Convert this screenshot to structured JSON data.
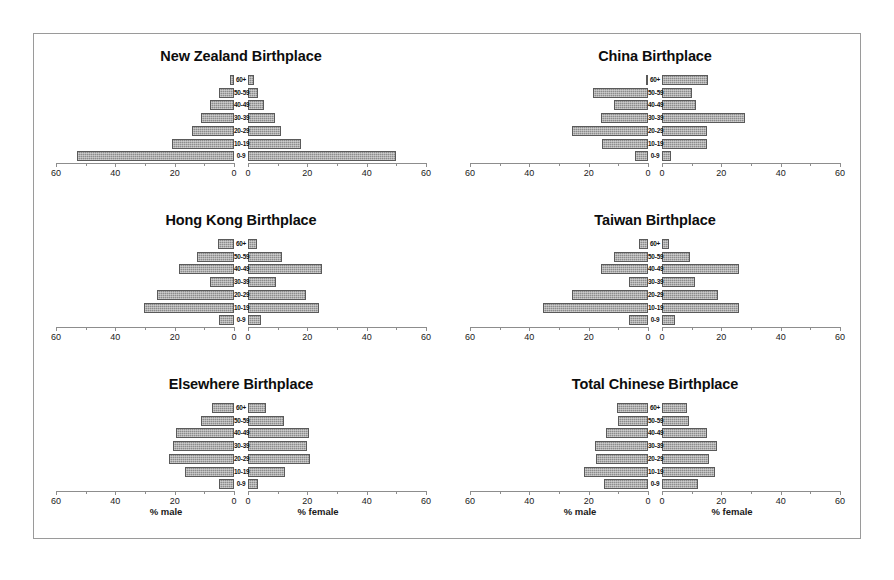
{
  "figure": {
    "axis_caption_male": "% male",
    "axis_caption_female": "% female",
    "bar_color": "#8c8c8c",
    "bar_border_color": "#5a5a5a",
    "frame_color": "#9a9a9a",
    "axis_color": "#8d8d8d"
  },
  "chart_data": {
    "type": "bar",
    "subtype": "population-pyramid",
    "title": "",
    "xlabel": "% male / % female",
    "ylabel": "Age group",
    "xlim": [
      0,
      60
    ],
    "xticks": [
      0,
      20,
      40,
      60
    ],
    "xtick_labels": [
      "0",
      "20",
      "40",
      "60"
    ],
    "minor_tick_step": 10,
    "grid": false,
    "legend": null,
    "categories": [
      "60+",
      "50-59",
      "40-49",
      "30-39",
      "20-29",
      "10-19",
      "0-9"
    ],
    "panels": [
      {
        "title": "New Zealand Birthplace",
        "series": [
          {
            "name": "% male",
            "values": [
              1.5,
              5.0,
              8.0,
              11.0,
              14.0,
              21.0,
              53.0
            ]
          },
          {
            "name": "% female",
            "values": [
              2.0,
              3.5,
              5.5,
              9.0,
              11.0,
              18.0,
              50.0
            ]
          }
        ]
      },
      {
        "title": "China Birthplace",
        "series": [
          {
            "name": "% male",
            "values": [
              0.5,
              18.5,
              11.5,
              16.0,
              25.5,
              15.5,
              18.0,
              4.5
            ]
          },
          {
            "name": "% female",
            "values": [
              15.5,
              10.0,
              11.5,
              28.0,
              15.0,
              15.0,
              3.0
            ]
          }
        ],
        "male_values": [
          0.5,
          18.5,
          11.5,
          16.0,
          25.5,
          15.5,
          18.0
        ],
        "female_values": [
          15.5,
          10.0,
          11.5,
          28.0,
          15.0,
          15.0,
          3.0
        ],
        "male_values_fixed": [
          0.5,
          18.5,
          11.5,
          16.0,
          25.5,
          15.5,
          4.5
        ]
      },
      {
        "title": "Hong Kong Birthplace",
        "series": [
          {
            "name": "% male",
            "values": [
              5.5,
              12.5,
              18.5,
              8.0,
              26.0,
              30.5,
              5.0
            ]
          },
          {
            "name": "% female",
            "values": [
              3.0,
              11.5,
              25.0,
              9.5,
              19.5,
              24.0,
              4.5
            ]
          }
        ]
      },
      {
        "title": "Taiwan Birthplace",
        "series": [
          {
            "name": "% male",
            "values": [
              3.0,
              11.5,
              16.0,
              6.5,
              25.5,
              35.5,
              6.5
            ]
          },
          {
            "name": "% female",
            "values": [
              2.5,
              9.5,
              26.0,
              11.0,
              19.0,
              26.0,
              4.5
            ]
          }
        ]
      },
      {
        "title": "Elsewhere Birthplace",
        "series": [
          {
            "name": "% male",
            "values": [
              7.5,
              11.0,
              19.5,
              20.5,
              22.0,
              16.5,
              5.0
            ]
          },
          {
            "name": "% female",
            "values": [
              6.0,
              12.0,
              20.5,
              20.0,
              21.0,
              12.5,
              3.5
            ]
          }
        ]
      },
      {
        "title": "Total Chinese Birthplace",
        "series": [
          {
            "name": "% male",
            "values": [
              10.5,
              10.0,
              14.0,
              18.0,
              17.5,
              21.5,
              15.0
            ]
          },
          {
            "name": "% female",
            "values": [
              8.5,
              9.0,
              15.0,
              18.5,
              16.0,
              18.0,
              12.0
            ]
          }
        ]
      }
    ]
  }
}
